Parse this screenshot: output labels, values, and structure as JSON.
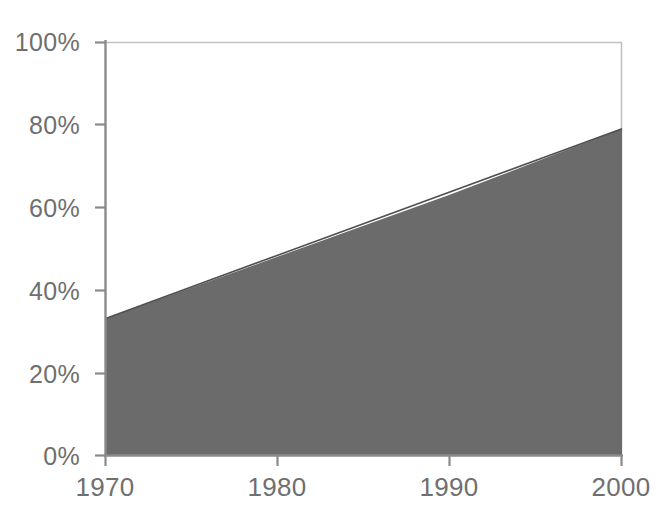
{
  "chart_data": {
    "type": "area",
    "title": "",
    "subtitle": "",
    "xlabel": "",
    "ylabel": "",
    "x": [
      1970,
      2000
    ],
    "values": [
      33,
      79
    ],
    "series": [
      {
        "name": "share",
        "x": [
          1970,
          1975,
          1980,
          1985,
          1990,
          1995,
          2000
        ],
        "values": [
          33,
          40.5,
          48,
          55.5,
          63,
          71,
          79
        ]
      }
    ],
    "xlim": [
      1970,
      2000
    ],
    "ylim": [
      0,
      100
    ],
    "x_ticks": [
      1970,
      1980,
      1990,
      2000
    ],
    "x_tick_labels": [
      "1970",
      "1980",
      "1990",
      "2000"
    ],
    "y_ticks": [
      0,
      20,
      40,
      60,
      80,
      100
    ],
    "y_tick_labels": [
      "0%",
      "20%",
      "40%",
      "60%",
      "80%",
      "100%"
    ],
    "grid": false,
    "legend": "none",
    "annotations": [],
    "colors": {
      "area_fill": "#6b6b6b",
      "axis": "#8a8a8a",
      "plot_border": "#b9b9b9",
      "tick_text": "#6f6f6f",
      "background": "#ffffff"
    }
  },
  "axis": {
    "y_labels": [
      "100%",
      "80%",
      "60%",
      "40%",
      "20%",
      "0%"
    ],
    "x_labels": [
      "1970",
      "1980",
      "1990",
      "2000"
    ]
  }
}
